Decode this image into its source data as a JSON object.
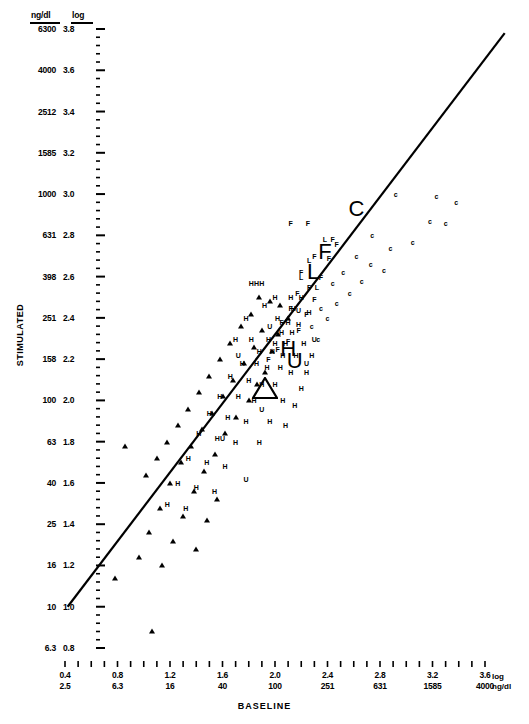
{
  "axes": {
    "y_title": "STIMULATED",
    "x_title": "BASELINE",
    "y_header_ng": "ng/dl",
    "y_header_log": "log",
    "x_corner_log": "log",
    "x_corner_ng": "ng/dl"
  },
  "chart_data": {
    "type": "scatter",
    "title": "",
    "xlabel": "BASELINE",
    "ylabel": "STIMULATED",
    "grid": false,
    "legend": "none",
    "scale": "log-log dual axis (log value and ng/dl)",
    "xlim_log": [
      0.3,
      3.8
    ],
    "ylim_log": [
      0.75,
      3.05
    ],
    "y_ticks_log": [
      3.0,
      2.8,
      2.6,
      2.4,
      2.2,
      2.0,
      1.8,
      1.6,
      1.4,
      1.2,
      1.0,
      0.8
    ],
    "y_ticks_ngdl": [
      6300,
      4000,
      2512,
      1585,
      1000,
      631,
      398,
      251,
      158,
      100,
      63,
      40,
      25,
      16,
      10,
      6.3
    ],
    "y_ticks_ngdl_log": [
      3.8,
      3.6,
      3.4,
      3.2,
      3.0,
      2.8,
      2.6,
      2.4,
      2.2,
      2.0,
      1.8,
      1.6,
      1.4,
      1.2,
      1.0,
      0.8
    ],
    "x_ticks_log": [
      0.4,
      0.8,
      1.2,
      1.6,
      2.0,
      2.4,
      2.8,
      3.2,
      3.6
    ],
    "x_ticks_ngdl": [
      2.5,
      6.3,
      16,
      40,
      100,
      251,
      631,
      1585,
      4000
    ],
    "regression_line": {
      "x_start_log": 0.42,
      "y_start_log": 1.0,
      "x_end_log": 3.75,
      "y_end_log": 3.78,
      "style": "solid black identity-like regression line"
    },
    "marker_groups": [
      {
        "code": "H",
        "label": "H",
        "style": "letter"
      },
      {
        "code": "C",
        "label": "c",
        "style": "letter"
      },
      {
        "code": "F",
        "label": "F",
        "style": "letter"
      },
      {
        "code": "L",
        "label": "L",
        "style": "letter"
      },
      {
        "code": "U",
        "label": "U",
        "style": "letter"
      },
      {
        "code": "T",
        "label": "triangle",
        "style": "filled-triangle"
      }
    ],
    "group_centroids": [
      {
        "code": "C",
        "label": "C",
        "x": 2.62,
        "y": 2.93
      },
      {
        "code": "F",
        "label": "F",
        "x": 2.38,
        "y": 2.72
      },
      {
        "code": "L",
        "label": "L",
        "x": 2.29,
        "y": 2.62
      },
      {
        "code": "H",
        "label": "H",
        "x": 2.1,
        "y": 2.25
      },
      {
        "code": "U",
        "label": "U",
        "x": 2.15,
        "y": 2.19
      },
      {
        "code": "T",
        "label": "triangle",
        "x": 1.92,
        "y": 2.06
      }
    ],
    "points": [
      {
        "g": "c",
        "x": 3.23,
        "y": 2.99
      },
      {
        "g": "c",
        "x": 2.92,
        "y": 3.0
      },
      {
        "g": "c",
        "x": 3.38,
        "y": 2.96
      },
      {
        "g": "c",
        "x": 3.18,
        "y": 2.87
      },
      {
        "g": "c",
        "x": 3.3,
        "y": 2.86
      },
      {
        "g": "c",
        "x": 3.05,
        "y": 2.77
      },
      {
        "g": "c",
        "x": 2.74,
        "y": 2.8
      },
      {
        "g": "c",
        "x": 2.88,
        "y": 2.74
      },
      {
        "g": "c",
        "x": 2.62,
        "y": 2.7
      },
      {
        "g": "c",
        "x": 2.73,
        "y": 2.66
      },
      {
        "g": "c",
        "x": 2.83,
        "y": 2.63
      },
      {
        "g": "c",
        "x": 2.52,
        "y": 2.62
      },
      {
        "g": "c",
        "x": 2.66,
        "y": 2.58
      },
      {
        "g": "c",
        "x": 2.44,
        "y": 2.57
      },
      {
        "g": "c",
        "x": 2.57,
        "y": 2.52
      },
      {
        "g": "c",
        "x": 2.47,
        "y": 2.47
      },
      {
        "g": "c",
        "x": 2.35,
        "y": 2.45
      },
      {
        "g": "c",
        "x": 2.4,
        "y": 2.4
      },
      {
        "g": "c",
        "x": 2.28,
        "y": 2.36
      },
      {
        "g": "c",
        "x": 2.33,
        "y": 2.3
      },
      {
        "g": "F",
        "x": 2.12,
        "y": 2.86
      },
      {
        "g": "F",
        "x": 2.25,
        "y": 2.86
      },
      {
        "g": "F",
        "x": 2.44,
        "y": 2.78
      },
      {
        "g": "F",
        "x": 2.47,
        "y": 2.76
      },
      {
        "g": "F",
        "x": 2.3,
        "y": 2.7
      },
      {
        "g": "F",
        "x": 2.41,
        "y": 2.69
      },
      {
        "g": "F",
        "x": 2.2,
        "y": 2.62
      },
      {
        "g": "F",
        "x": 2.35,
        "y": 2.6
      },
      {
        "g": "F",
        "x": 2.26,
        "y": 2.55
      },
      {
        "g": "F",
        "x": 2.17,
        "y": 2.52
      },
      {
        "g": "F",
        "x": 2.3,
        "y": 2.49
      },
      {
        "g": "F",
        "x": 2.12,
        "y": 2.45
      },
      {
        "g": "F",
        "x": 2.24,
        "y": 2.42
      },
      {
        "g": "F",
        "x": 2.05,
        "y": 2.38
      },
      {
        "g": "F",
        "x": 2.18,
        "y": 2.34
      },
      {
        "g": "F",
        "x": 2.1,
        "y": 2.29
      },
      {
        "g": "F",
        "x": 2.02,
        "y": 2.25
      },
      {
        "g": "F",
        "x": 1.95,
        "y": 2.2
      },
      {
        "g": "L",
        "x": 2.38,
        "y": 2.78
      },
      {
        "g": "L",
        "x": 2.26,
        "y": 2.68
      },
      {
        "g": "L",
        "x": 2.2,
        "y": 2.6
      },
      {
        "g": "L",
        "x": 2.32,
        "y": 2.55
      },
      {
        "g": "H",
        "x": 1.82,
        "y": 2.57
      },
      {
        "g": "H",
        "x": 1.86,
        "y": 2.57
      },
      {
        "g": "H",
        "x": 1.9,
        "y": 2.57
      },
      {
        "g": "H",
        "x": 2.0,
        "y": 2.5
      },
      {
        "g": "H",
        "x": 2.12,
        "y": 2.5
      },
      {
        "g": "H",
        "x": 2.2,
        "y": 2.5
      },
      {
        "g": "H",
        "x": 1.92,
        "y": 2.46
      },
      {
        "g": "H",
        "x": 2.14,
        "y": 2.45
      },
      {
        "g": "H",
        "x": 2.26,
        "y": 2.43
      },
      {
        "g": "H",
        "x": 1.78,
        "y": 2.4
      },
      {
        "g": "H",
        "x": 2.02,
        "y": 2.4
      },
      {
        "g": "H",
        "x": 2.1,
        "y": 2.38
      },
      {
        "g": "H",
        "x": 2.18,
        "y": 2.37
      },
      {
        "g": "H",
        "x": 2.05,
        "y": 2.33
      },
      {
        "g": "H",
        "x": 2.13,
        "y": 2.33
      },
      {
        "g": "H",
        "x": 1.7,
        "y": 2.3
      },
      {
        "g": "H",
        "x": 1.82,
        "y": 2.3
      },
      {
        "g": "H",
        "x": 1.95,
        "y": 2.3
      },
      {
        "g": "H",
        "x": 2.0,
        "y": 2.28
      },
      {
        "g": "H",
        "x": 2.08,
        "y": 2.28
      },
      {
        "g": "H",
        "x": 2.22,
        "y": 2.28
      },
      {
        "g": "H",
        "x": 1.88,
        "y": 2.24
      },
      {
        "g": "H",
        "x": 1.98,
        "y": 2.24
      },
      {
        "g": "H",
        "x": 2.06,
        "y": 2.22
      },
      {
        "g": "H",
        "x": 2.16,
        "y": 2.22
      },
      {
        "g": "H",
        "x": 2.28,
        "y": 2.22
      },
      {
        "g": "H",
        "x": 1.75,
        "y": 2.18
      },
      {
        "g": "H",
        "x": 1.86,
        "y": 2.18
      },
      {
        "g": "H",
        "x": 1.94,
        "y": 2.16
      },
      {
        "g": "H",
        "x": 2.04,
        "y": 2.16
      },
      {
        "g": "H",
        "x": 2.12,
        "y": 2.14
      },
      {
        "g": "H",
        "x": 2.24,
        "y": 2.14
      },
      {
        "g": "H",
        "x": 1.66,
        "y": 2.12
      },
      {
        "g": "H",
        "x": 1.8,
        "y": 2.1
      },
      {
        "g": "H",
        "x": 1.9,
        "y": 2.08
      },
      {
        "g": "H",
        "x": 2.0,
        "y": 2.08
      },
      {
        "g": "H",
        "x": 2.2,
        "y": 2.06
      },
      {
        "g": "H",
        "x": 1.58,
        "y": 2.02
      },
      {
        "g": "H",
        "x": 1.72,
        "y": 2.02
      },
      {
        "g": "H",
        "x": 1.84,
        "y": 2.0
      },
      {
        "g": "H",
        "x": 2.06,
        "y": 2.0
      },
      {
        "g": "H",
        "x": 2.15,
        "y": 1.98
      },
      {
        "g": "H",
        "x": 1.5,
        "y": 1.94
      },
      {
        "g": "H",
        "x": 1.64,
        "y": 1.92
      },
      {
        "g": "H",
        "x": 1.78,
        "y": 1.9
      },
      {
        "g": "H",
        "x": 1.96,
        "y": 1.9
      },
      {
        "g": "H",
        "x": 2.08,
        "y": 1.88
      },
      {
        "g": "H",
        "x": 1.42,
        "y": 1.84
      },
      {
        "g": "H",
        "x": 1.56,
        "y": 1.82
      },
      {
        "g": "H",
        "x": 1.7,
        "y": 1.8
      },
      {
        "g": "H",
        "x": 1.88,
        "y": 1.8
      },
      {
        "g": "H",
        "x": 1.34,
        "y": 1.72
      },
      {
        "g": "H",
        "x": 1.48,
        "y": 1.7
      },
      {
        "g": "H",
        "x": 1.62,
        "y": 1.68
      },
      {
        "g": "H",
        "x": 1.26,
        "y": 1.6
      },
      {
        "g": "H",
        "x": 1.4,
        "y": 1.58
      },
      {
        "g": "H",
        "x": 1.54,
        "y": 1.56
      },
      {
        "g": "H",
        "x": 1.18,
        "y": 1.5
      },
      {
        "g": "H",
        "x": 1.32,
        "y": 1.48
      },
      {
        "g": "U",
        "x": 2.18,
        "y": 2.44
      },
      {
        "g": "U",
        "x": 1.96,
        "y": 2.36
      },
      {
        "g": "U",
        "x": 2.3,
        "y": 2.3
      },
      {
        "g": "U",
        "x": 1.72,
        "y": 2.22
      },
      {
        "g": "U",
        "x": 2.24,
        "y": 2.18
      },
      {
        "g": "U",
        "x": 1.9,
        "y": 1.96
      },
      {
        "g": "U",
        "x": 1.6,
        "y": 1.82
      },
      {
        "g": "U",
        "x": 1.78,
        "y": 1.62
      },
      {
        "g": "T",
        "x": 1.88,
        "y": 2.5
      },
      {
        "g": "T",
        "x": 1.96,
        "y": 2.48
      },
      {
        "g": "T",
        "x": 2.04,
        "y": 2.46
      },
      {
        "g": "T",
        "x": 1.82,
        "y": 2.42
      },
      {
        "g": "T",
        "x": 2.1,
        "y": 2.4
      },
      {
        "g": "T",
        "x": 1.74,
        "y": 2.36
      },
      {
        "g": "T",
        "x": 1.9,
        "y": 2.34
      },
      {
        "g": "T",
        "x": 2.02,
        "y": 2.32
      },
      {
        "g": "T",
        "x": 1.66,
        "y": 2.28
      },
      {
        "g": "T",
        "x": 1.84,
        "y": 2.26
      },
      {
        "g": "T",
        "x": 1.98,
        "y": 2.24
      },
      {
        "g": "T",
        "x": 1.58,
        "y": 2.2
      },
      {
        "g": "T",
        "x": 1.76,
        "y": 2.18
      },
      {
        "g": "T",
        "x": 1.92,
        "y": 2.14
      },
      {
        "g": "T",
        "x": 1.5,
        "y": 2.12
      },
      {
        "g": "T",
        "x": 1.68,
        "y": 2.1
      },
      {
        "g": "T",
        "x": 1.86,
        "y": 2.08
      },
      {
        "g": "T",
        "x": 1.42,
        "y": 2.04
      },
      {
        "g": "T",
        "x": 1.6,
        "y": 2.02
      },
      {
        "g": "T",
        "x": 1.8,
        "y": 2.0
      },
      {
        "g": "T",
        "x": 1.34,
        "y": 1.96
      },
      {
        "g": "T",
        "x": 1.52,
        "y": 1.94
      },
      {
        "g": "T",
        "x": 1.7,
        "y": 1.92
      },
      {
        "g": "T",
        "x": 1.26,
        "y": 1.88
      },
      {
        "g": "T",
        "x": 1.44,
        "y": 1.86
      },
      {
        "g": "T",
        "x": 1.62,
        "y": 1.84
      },
      {
        "g": "T",
        "x": 1.18,
        "y": 1.8
      },
      {
        "g": "T",
        "x": 1.36,
        "y": 1.78
      },
      {
        "g": "T",
        "x": 1.54,
        "y": 1.74
      },
      {
        "g": "T",
        "x": 1.1,
        "y": 1.72
      },
      {
        "g": "T",
        "x": 1.28,
        "y": 1.7
      },
      {
        "g": "T",
        "x": 1.46,
        "y": 1.66
      },
      {
        "g": "T",
        "x": 0.86,
        "y": 1.78
      },
      {
        "g": "T",
        "x": 1.02,
        "y": 1.64
      },
      {
        "g": "T",
        "x": 1.2,
        "y": 1.6
      },
      {
        "g": "T",
        "x": 1.38,
        "y": 1.56
      },
      {
        "g": "T",
        "x": 1.56,
        "y": 1.52
      },
      {
        "g": "T",
        "x": 1.12,
        "y": 1.48
      },
      {
        "g": "T",
        "x": 1.3,
        "y": 1.44
      },
      {
        "g": "T",
        "x": 1.48,
        "y": 1.42
      },
      {
        "g": "T",
        "x": 1.04,
        "y": 1.36
      },
      {
        "g": "T",
        "x": 1.22,
        "y": 1.32
      },
      {
        "g": "T",
        "x": 1.4,
        "y": 1.28
      },
      {
        "g": "T",
        "x": 0.96,
        "y": 1.24
      },
      {
        "g": "T",
        "x": 1.14,
        "y": 1.2
      },
      {
        "g": "T",
        "x": 0.78,
        "y": 1.14
      },
      {
        "g": "T",
        "x": 1.06,
        "y": 0.88
      }
    ]
  }
}
